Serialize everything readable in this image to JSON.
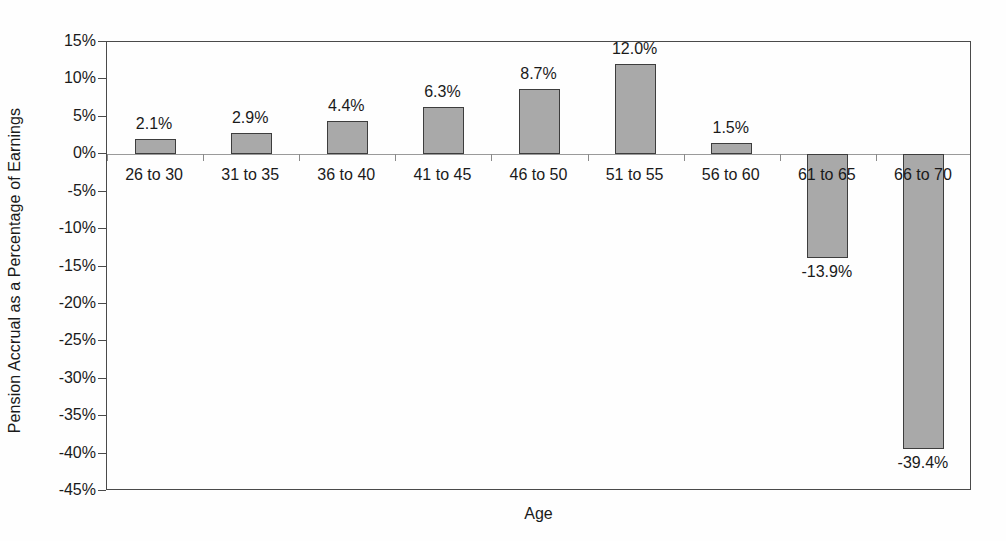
{
  "chart_data": {
    "type": "bar",
    "title": "",
    "xlabel": "Age",
    "ylabel": "Pension Accrual as a Percentage of Earnings",
    "categories": [
      "26 to 30",
      "31 to 35",
      "36 to 40",
      "41 to 45",
      "46 to 50",
      "51 to 55",
      "56 to 60",
      "61 to 65",
      "66 to 70"
    ],
    "values": [
      2.1,
      2.9,
      4.4,
      6.3,
      8.7,
      12.0,
      1.5,
      -13.9,
      -39.4
    ],
    "value_labels": [
      "2.1%",
      "2.9%",
      "4.4%",
      "6.3%",
      "8.7%",
      "12.0%",
      "1.5%",
      "-13.9%",
      "-39.4%"
    ],
    "ylim": [
      -45,
      15
    ],
    "ytick_values": [
      15,
      10,
      5,
      0,
      -5,
      -10,
      -15,
      -20,
      -25,
      -30,
      -35,
      -40,
      -45
    ],
    "ytick_labels": [
      "15%",
      "10%",
      "5%",
      "0%",
      "-5%",
      "-10%",
      "-15%",
      "-20%",
      "-25%",
      "-30%",
      "-35%",
      "-40%",
      "-45%"
    ],
    "grid": false,
    "legend": false,
    "legend_position": "none",
    "bar_color": "#a9a9a9",
    "bar_border_color": "#3d3d3d",
    "axis_color": "#4a4a4a",
    "background_color": "#fefefe"
  }
}
